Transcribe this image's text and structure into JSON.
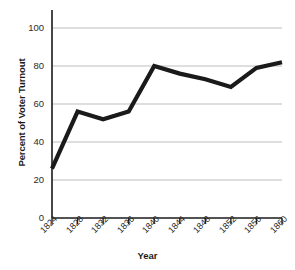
{
  "chart_data": {
    "type": "line",
    "title": "",
    "xlabel": "Year",
    "ylabel": "Percent of Voter Turnout",
    "x": [
      1824,
      1828,
      1832,
      1836,
      1840,
      1844,
      1848,
      1852,
      1856,
      1860
    ],
    "categories": [
      "1824",
      "1828",
      "1832",
      "1836",
      "1840",
      "1844",
      "1848",
      "1852",
      "1856",
      "1860"
    ],
    "values": [
      26,
      56,
      52,
      56,
      80,
      76,
      73,
      69,
      79,
      82
    ],
    "series": [
      {
        "name": "Percent of Voter Turnout",
        "values": [
          26,
          56,
          52,
          56,
          80,
          76,
          73,
          69,
          79,
          82
        ]
      }
    ],
    "xlim": [
      1824,
      1860
    ],
    "ylim": [
      0,
      100
    ],
    "ytick_labels": [
      "0",
      "20",
      "40",
      "60",
      "80",
      "100"
    ],
    "ytick_values": [
      0,
      20,
      40,
      60,
      80,
      100
    ],
    "xtick_labels": [
      "1824",
      "1828",
      "1832",
      "1836",
      "1840",
      "1844",
      "1848",
      "1852",
      "1856",
      "1860"
    ],
    "grid": "horizontal",
    "legend": "none",
    "line_color": "#1a1a1a",
    "grid_color": "#b5b5b5",
    "axis_color": "#1a1a1a",
    "background": "#ffffff"
  }
}
